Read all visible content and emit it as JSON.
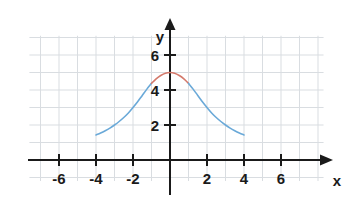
{
  "chart_data": {
    "type": "line",
    "title": "",
    "subtitle": "",
    "xlabel": "x",
    "ylabel": "y",
    "xlim": [
      -7.6,
      8.3
    ],
    "ylim": [
      -1.2,
      7.1
    ],
    "grid": true,
    "grid_step": 1,
    "legend": "none",
    "x_ticks": [
      -6,
      -4,
      -2,
      2,
      4,
      6
    ],
    "x_tick_labels": [
      "-6",
      "-4",
      "-2",
      "2",
      "4",
      "6"
    ],
    "y_ticks": [
      2,
      4,
      6
    ],
    "y_tick_labels": [
      "2",
      "4",
      "6"
    ],
    "axis_arrow_x": "right",
    "axis_arrow_y": "up",
    "series": [
      {
        "name": "curve-tails",
        "color": "#6aa9d8",
        "segment": "outer",
        "x": [
          -4.0,
          -3.75,
          -3.5,
          -3.25,
          -3.0,
          -2.75,
          -2.5,
          -2.25,
          -2.0,
          -1.75,
          -1.5,
          -1.25,
          -1.0
        ],
        "y": [
          1.43,
          1.54,
          1.67,
          1.82,
          2.0,
          2.2,
          2.43,
          2.69,
          3.0,
          3.33,
          3.69,
          4.05,
          4.38
        ]
      },
      {
        "name": "curve-peak",
        "color": "#d4796b",
        "segment": "center",
        "x": [
          -1.0,
          -0.75,
          -0.5,
          -0.25,
          0.0,
          0.25,
          0.5,
          0.75,
          1.0
        ],
        "y": [
          4.38,
          4.64,
          4.83,
          4.96,
          5.0,
          4.96,
          4.83,
          4.64,
          4.38
        ]
      },
      {
        "name": "curve-tails-right",
        "color": "#6aa9d8",
        "segment": "outer",
        "x": [
          1.0,
          1.25,
          1.5,
          1.75,
          2.0,
          2.25,
          2.5,
          2.75,
          3.0,
          3.25,
          3.5,
          3.75,
          4.0
        ],
        "y": [
          4.38,
          4.05,
          3.69,
          3.33,
          3.0,
          2.69,
          2.43,
          2.2,
          2.0,
          1.82,
          1.67,
          1.54,
          1.43
        ]
      }
    ],
    "peak": {
      "x": 0,
      "y": 5
    },
    "endpoints": [
      {
        "x": -4,
        "y": 1.43
      },
      {
        "x": 4,
        "y": 1.43
      }
    ],
    "colors": {
      "grid": "#d9dde1",
      "axis": "#1a1a1a",
      "curve_outer": "#6aa9d8",
      "curve_center": "#d4796b",
      "background": "#ffffff",
      "text": "#1a1a1a"
    }
  }
}
